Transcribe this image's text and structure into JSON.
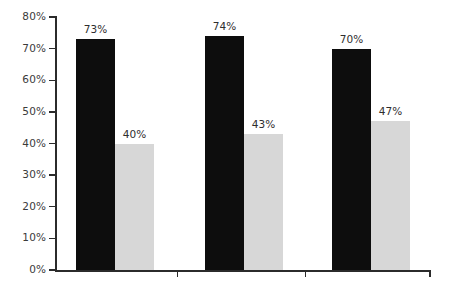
{
  "chart_data": {
    "type": "bar",
    "title": "",
    "subtitle": "",
    "xlabel": "",
    "ylabel": "",
    "categories": [
      "Group 1",
      "Group 2",
      "Group 3"
    ],
    "series": [
      {
        "name": "Series 1",
        "color": "#0d0d0d",
        "values": [
          73,
          74,
          70
        ]
      },
      {
        "name": "Series 2",
        "color": "#d7d7d7",
        "values": [
          40,
          43,
          47
        ]
      }
    ],
    "data_labels": [
      "73%",
      "40%",
      "74%",
      "43%",
      "70%",
      "47%"
    ],
    "ylim": [
      0,
      80
    ],
    "ytick_values": [
      0,
      10,
      20,
      30,
      40,
      50,
      60,
      70,
      80
    ],
    "ytick_labels": [
      "0%",
      "10%",
      "20%",
      "30%",
      "40%",
      "50%",
      "60%",
      "70%",
      "80%"
    ],
    "xtick_labels": [
      "",
      "",
      ""
    ],
    "grid": false,
    "legend": "none",
    "axis_color": "#2b2b2b",
    "label_color": "#3b3b3b",
    "background": "#ffffff"
  },
  "axis": {
    "ticks": [
      {
        "label": "80%",
        "value": 80
      },
      {
        "label": "70%",
        "value": 70
      },
      {
        "label": "60%",
        "value": 60
      },
      {
        "label": "50%",
        "value": 50
      },
      {
        "label": "40%",
        "value": 40
      },
      {
        "label": "30%",
        "value": 30
      },
      {
        "label": "20%",
        "value": 20
      },
      {
        "label": "10%",
        "value": 10
      },
      {
        "label": "0%",
        "value": 0
      }
    ]
  },
  "bars": [
    {
      "label": "73%",
      "value": 73,
      "series": "Series 1",
      "group": "Group 1"
    },
    {
      "label": "40%",
      "value": 40,
      "series": "Series 2",
      "group": "Group 1"
    },
    {
      "label": "74%",
      "value": 74,
      "series": "Series 1",
      "group": "Group 2"
    },
    {
      "label": "43%",
      "value": 43,
      "series": "Series 2",
      "group": "Group 2"
    },
    {
      "label": "70%",
      "value": 70,
      "series": "Series 1",
      "group": "Group 3"
    },
    {
      "label": "47%",
      "value": 47,
      "series": "Series 2",
      "group": "Group 3"
    }
  ]
}
